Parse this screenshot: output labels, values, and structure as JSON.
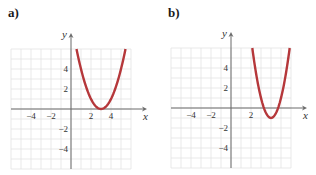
{
  "panels": [
    {
      "label": "a)"
    },
    {
      "label": "b)"
    }
  ],
  "colors": {
    "curve": "#b5373a",
    "grid": "#e3e3e3",
    "axis": "#6a6a6a",
    "text": "#333333"
  },
  "chart_data": [
    {
      "type": "line",
      "title": "a)",
      "xlabel": "x",
      "ylabel": "y",
      "xlim": [
        -6,
        6
      ],
      "ylim": [
        -6,
        6
      ],
      "grid": true,
      "x_ticks": [
        -4,
        -2,
        2,
        4
      ],
      "y_ticks": [
        4,
        2,
        -2,
        -4
      ],
      "series": [
        {
          "name": "y = (x - 3)^2",
          "vertex": [
            3,
            0
          ],
          "x": [
            0.55,
            1,
            1.5,
            2,
            2.5,
            3,
            3.5,
            4,
            4.5,
            5,
            5.45
          ],
          "y": [
            6,
            4,
            2.25,
            1,
            0.25,
            0,
            0.25,
            1,
            2.25,
            4,
            6
          ]
        }
      ]
    },
    {
      "type": "line",
      "title": "b)",
      "xlabel": "x",
      "ylabel": "y",
      "xlim": [
        -6,
        6
      ],
      "ylim": [
        -6,
        6
      ],
      "grid": true,
      "x_ticks": [
        -4,
        -2,
        2
      ],
      "y_ticks": [
        4,
        2,
        -2,
        -4
      ],
      "series": [
        {
          "name": "y = 2(x - 4)^2 - 1",
          "vertex": [
            4,
            -1
          ],
          "x": [
            2.13,
            2.5,
            3,
            3.5,
            4,
            4.5,
            5,
            5.5,
            5.87
          ],
          "y": [
            6,
            3.5,
            1,
            -0.5,
            -1,
            -0.5,
            1,
            3.5,
            6
          ]
        }
      ]
    }
  ]
}
